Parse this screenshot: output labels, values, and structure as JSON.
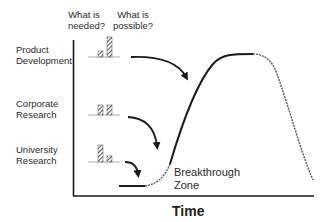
{
  "diagram": {
    "column_headers": [
      {
        "id": "needed",
        "text_line1": "What is",
        "text_line2": "needed?"
      },
      {
        "id": "possible",
        "text_line1": "What is",
        "text_line2": "possible?"
      }
    ],
    "rows": [
      {
        "id": "product-development",
        "line1": "Product",
        "line2": "Development",
        "needed_level": 0.3,
        "possible_level": 1.0
      },
      {
        "id": "corporate-research",
        "line1": "Corporate",
        "line2": "Research",
        "needed_level": 0.5,
        "possible_level": 0.5
      },
      {
        "id": "university-research",
        "line1": "University",
        "line2": "Research",
        "needed_level": 0.85,
        "possible_level": 0.3
      }
    ],
    "zone_label_line1": "Breakthrough",
    "zone_label_line2": "Zone",
    "x_axis_label": "Time",
    "colors": {
      "ink": "#1a1a1a",
      "dashed": "#555555"
    }
  }
}
